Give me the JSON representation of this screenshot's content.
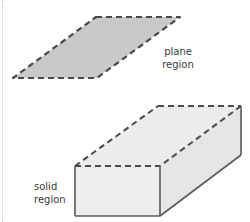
{
  "diagram": {
    "plane": {
      "label_line1": "plane",
      "label_line2": "region",
      "fill": "#c9c9c9",
      "stroke": "#4a4a4a",
      "points": [
        [
          96,
          17
        ],
        [
          180,
          17
        ],
        [
          97,
          78
        ],
        [
          13,
          78
        ]
      ]
    },
    "solid": {
      "label_line1": "solid",
      "label_line2": "region",
      "front_fill": "#ececec",
      "top_fill": "#ececec",
      "side_fill": "#e8e8e8",
      "stroke": "#555555",
      "front_face": [
        [
          75,
          166
        ],
        [
          160,
          166
        ],
        [
          160,
          216
        ],
        [
          75,
          216
        ]
      ],
      "top_back_edge": [
        [
          158,
          106
        ],
        [
          241,
          106
        ]
      ],
      "right_back_edge": [
        [
          241,
          106
        ],
        [
          241,
          155
        ]
      ]
    }
  }
}
